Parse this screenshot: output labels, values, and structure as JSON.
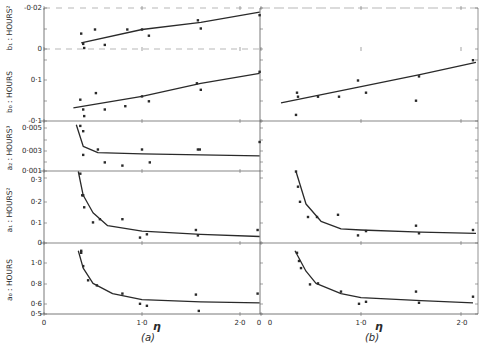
{
  "chart_data": [
    {
      "panel": "(a)",
      "type": "scatter",
      "title": "",
      "xlabel": "η",
      "x_ticks": [
        "0",
        "1·0",
        "2·0"
      ],
      "xlim": [
        0,
        2.2
      ],
      "subplots": [
        {
          "id": "b1",
          "ylabel": "b₁ : HOURS²",
          "y_ticks": [
            "-0·02",
            "0"
          ],
          "ylim": [
            -0.005,
            0.02
          ],
          "points": [
            [
              0.38,
              0.0075
            ],
            [
              0.4,
              0.0025
            ],
            [
              0.41,
              0.0005
            ],
            [
              0.52,
              0.0095
            ],
            [
              0.62,
              0.002
            ],
            [
              0.85,
              0.0095
            ],
            [
              1.0,
              0.0095
            ],
            [
              1.07,
              0.0065
            ],
            [
              1.57,
              0.014
            ],
            [
              1.6,
              0.01
            ],
            [
              2.2,
              0.0165
            ]
          ],
          "fit": [
            [
              0.38,
              0.003
            ],
            [
              1.0,
              0.0095
            ],
            [
              1.6,
              0.013
            ],
            [
              2.2,
              0.018
            ]
          ]
        },
        {
          "id": "b0",
          "ylabel": "b₀ : HOURS",
          "y_ticks": [
            "0·1",
            "-0·1"
          ],
          "ylim": [
            -0.2,
            0.05
          ],
          "points": [
            [
              0.37,
              -0.11
            ],
            [
              0.4,
              -0.14
            ],
            [
              0.41,
              -0.16
            ],
            [
              0.53,
              -0.09
            ],
            [
              0.62,
              -0.14
            ],
            [
              0.83,
              -0.13
            ],
            [
              1.0,
              -0.1
            ],
            [
              1.07,
              -0.115
            ],
            [
              1.56,
              -0.06
            ],
            [
              1.6,
              -0.08
            ],
            [
              2.2,
              -0.025
            ]
          ],
          "fit": [
            [
              0.3,
              -0.135
            ],
            [
              1.0,
              -0.1
            ],
            [
              1.6,
              -0.06
            ],
            [
              2.2,
              -0.03
            ]
          ]
        },
        {
          "id": "a2",
          "ylabel": "a₂ : HOURS³",
          "y_ticks": [
            "0·005",
            "0·003",
            "0·001"
          ],
          "ylim": [
            0.001,
            0.0055
          ],
          "points": [
            [
              0.37,
              0.0052
            ],
            [
              0.4,
              0.0047
            ],
            [
              0.4,
              0.0025
            ],
            [
              0.55,
              0.003
            ],
            [
              0.62,
              0.0018
            ],
            [
              0.8,
              0.0015
            ],
            [
              1.0,
              0.003
            ],
            [
              1.08,
              0.0018
            ],
            [
              1.57,
              0.003
            ],
            [
              1.59,
              0.003
            ],
            [
              2.2,
              0.0037
            ]
          ],
          "fit": [
            [
              0.33,
              0.0053
            ],
            [
              0.4,
              0.0033
            ],
            [
              0.55,
              0.0027
            ],
            [
              1.0,
              0.0026
            ],
            [
              1.6,
              0.0025
            ],
            [
              2.2,
              0.0024
            ]
          ]
        },
        {
          "id": "a1",
          "ylabel": "a₁ : HOURS²",
          "y_ticks": [
            "0·3",
            "0·2",
            "0·1",
            "0"
          ],
          "ylim": [
            0,
            0.33
          ],
          "points": [
            [
              0.37,
              0.32
            ],
            [
              0.39,
              0.22
            ],
            [
              0.4,
              0.22
            ],
            [
              0.41,
              0.165
            ],
            [
              0.5,
              0.095
            ],
            [
              0.57,
              0.11
            ],
            [
              0.8,
              0.11
            ],
            [
              0.98,
              0.025
            ],
            [
              1.05,
              0.04
            ],
            [
              1.55,
              0.06
            ],
            [
              1.57,
              0.035
            ],
            [
              2.18,
              0.06
            ]
          ],
          "fit": [
            [
              0.35,
              0.33
            ],
            [
              0.4,
              0.22
            ],
            [
              0.5,
              0.14
            ],
            [
              0.65,
              0.08
            ],
            [
              1.0,
              0.055
            ],
            [
              1.6,
              0.04
            ],
            [
              2.2,
              0.03
            ]
          ]
        },
        {
          "id": "a0",
          "ylabel": "a₀ : HOURS",
          "y_ticks": [
            "1·0",
            "0·8",
            "0·6",
            "0·5"
          ],
          "ylim": [
            0.5,
            1.15
          ],
          "points": [
            [
              0.38,
              1.12
            ],
            [
              0.38,
              1.1
            ],
            [
              0.4,
              0.97
            ],
            [
              0.45,
              0.83
            ],
            [
              0.54,
              0.78
            ],
            [
              0.8,
              0.7
            ],
            [
              0.98,
              0.6
            ],
            [
              1.05,
              0.58
            ],
            [
              1.55,
              0.69
            ],
            [
              1.58,
              0.53
            ],
            [
              2.18,
              0.7
            ]
          ],
          "fit": [
            [
              0.35,
              1.12
            ],
            [
              0.4,
              0.95
            ],
            [
              0.5,
              0.8
            ],
            [
              0.7,
              0.7
            ],
            [
              1.0,
              0.64
            ],
            [
              1.6,
              0.62
            ],
            [
              2.2,
              0.61
            ]
          ]
        }
      ]
    },
    {
      "panel": "(b)",
      "type": "scatter",
      "title": "",
      "xlabel": "η",
      "x_ticks": [
        "0",
        "1·0",
        "2·0"
      ],
      "xlim": [
        0,
        2.15
      ],
      "subplots": [
        {
          "id": "b0",
          "ylabel": "",
          "points": [
            [
              0.36,
              -0.13
            ],
            [
              0.37,
              -0.14
            ],
            [
              0.35,
              -0.185
            ],
            [
              0.57,
              -0.14
            ],
            [
              0.78,
              -0.14
            ],
            [
              0.97,
              -0.1
            ],
            [
              1.05,
              -0.13
            ],
            [
              1.55,
              -0.15
            ],
            [
              1.58,
              -0.09
            ],
            [
              2.12,
              -0.05
            ]
          ],
          "fit": [
            [
              0.2,
              -0.155
            ],
            [
              1.0,
              -0.115
            ],
            [
              1.6,
              -0.085
            ],
            [
              2.15,
              -0.055
            ]
          ]
        },
        {
          "id": "a1",
          "ylabel": "",
          "points": [
            [
              0.35,
              0.33
            ],
            [
              0.37,
              0.26
            ],
            [
              0.39,
              0.19
            ],
            [
              0.47,
              0.12
            ],
            [
              0.56,
              0.12
            ],
            [
              0.77,
              0.13
            ],
            [
              0.97,
              0.035
            ],
            [
              1.05,
              0.055
            ],
            [
              1.55,
              0.08
            ],
            [
              1.58,
              0.045
            ],
            [
              2.12,
              0.06
            ]
          ],
          "fit": [
            [
              0.35,
              0.33
            ],
            [
              0.45,
              0.18
            ],
            [
              0.6,
              0.1
            ],
            [
              0.8,
              0.065
            ],
            [
              1.0,
              0.06
            ],
            [
              1.6,
              0.05
            ],
            [
              2.15,
              0.045
            ]
          ]
        },
        {
          "id": "a0",
          "ylabel": "",
          "points": [
            [
              0.36,
              1.1
            ],
            [
              0.38,
              1.02
            ],
            [
              0.4,
              0.95
            ],
            [
              0.49,
              0.79
            ],
            [
              0.57,
              0.8
            ],
            [
              0.8,
              0.72
            ],
            [
              0.98,
              0.6
            ],
            [
              1.05,
              0.62
            ],
            [
              1.55,
              0.72
            ],
            [
              1.58,
              0.61
            ],
            [
              2.12,
              0.67
            ]
          ],
          "fit": [
            [
              0.34,
              1.12
            ],
            [
              0.45,
              0.92
            ],
            [
              0.55,
              0.8
            ],
            [
              0.8,
              0.7
            ],
            [
              1.0,
              0.66
            ],
            [
              1.6,
              0.63
            ],
            [
              2.12,
              0.61
            ]
          ]
        }
      ]
    }
  ],
  "labels": {
    "panel_a": "(a)",
    "panel_b": "(b)",
    "eta": "η",
    "x_origin_a": "0",
    "x_tick_a_1": "1·0",
    "x_tick_a_2": "2·0",
    "x_origin_b": "0",
    "x_tick_b_1": "1·0",
    "x_tick_b_2": "2·0",
    "x_edge_0": "0",
    "ylab_b1": "b₁ : HOURS²",
    "ylab_b0": "b₀ : HOURS",
    "ylab_a2": "a₂ : HOURS³",
    "ylab_a1": "a₁ : HOURS²",
    "ylab_a0": "a₀ : HOURS",
    "tick_b1_top": "-0·02",
    "tick_b1_zero": "0",
    "tick_b0_mid": "0·1",
    "tick_b0_bottom": "-0·1",
    "tick_a2_005": "0·005",
    "tick_a2_003": "0·003",
    "tick_a2_001": "0·001",
    "tick_a1_03": "0·3",
    "tick_a1_02": "0·2",
    "tick_a1_01": "0·1",
    "tick_a1_0": "0",
    "tick_a0_10": "1·0",
    "tick_a0_08": "0·8",
    "tick_a0_06": "0·6",
    "tick_a0_05": "0·5"
  },
  "colors": {
    "ink": "#2a2a2a",
    "background": "#ffffff",
    "frame": "#555555"
  }
}
